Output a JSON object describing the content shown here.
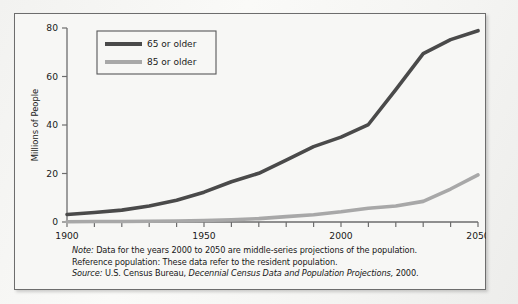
{
  "figure": {
    "background_color": "#f7f7f5",
    "frame_color": "#6d6d6d"
  },
  "axes": {
    "y_title": "Millions of People",
    "y_ticks": [
      "0",
      "20",
      "40",
      "60",
      "80"
    ],
    "x_ticks_labeled": [
      "1900",
      "1950",
      "2000",
      "2050"
    ]
  },
  "legend": {
    "items": [
      {
        "label": "65 or older",
        "color": "#4a4a4a"
      },
      {
        "label": "85 or older",
        "color": "#a8a8a8"
      }
    ]
  },
  "notes": {
    "note_keyword": "Note:",
    "note_text": "Data for the years 2000 to 2050 are middle-series projections of the population.",
    "reference_text": "Reference population: These data refer to the resident population.",
    "source_keyword": "Source:",
    "source_agency": "U.S. Census Bureau,",
    "source_title": "Decennial Census Data and Population Projections,",
    "source_year": "2000."
  },
  "chart_data": {
    "type": "line",
    "title": "",
    "xlabel": "",
    "ylabel": "Millions of People",
    "xlim": [
      1900,
      2050
    ],
    "ylim": [
      0,
      80
    ],
    "xticks": [
      1900,
      1910,
      1920,
      1930,
      1940,
      1950,
      1960,
      1970,
      1980,
      1990,
      2000,
      2010,
      2020,
      2030,
      2040,
      2050
    ],
    "xtick_labels": [
      "1900",
      "",
      "",
      "",
      "",
      "1950",
      "",
      "",
      "",
      "",
      "2000",
      "",
      "",
      "",
      "",
      "2050"
    ],
    "yticks": [
      0,
      20,
      40,
      60,
      80
    ],
    "grid": false,
    "legend_position": "upper left",
    "x": [
      1900,
      1910,
      1920,
      1930,
      1940,
      1950,
      1960,
      1970,
      1980,
      1990,
      2000,
      2010,
      2020,
      2030,
      2040,
      2050
    ],
    "series": [
      {
        "name": "65 or older",
        "color": "#4a4a4a",
        "values": [
          3.1,
          3.9,
          4.9,
          6.6,
          9.0,
          12.3,
          16.6,
          20.1,
          25.5,
          31.1,
          35.0,
          40.2,
          54.6,
          69.4,
          75.2,
          78.9
        ]
      },
      {
        "name": "85 or older",
        "color": "#a8a8a8",
        "values": [
          0.1,
          0.2,
          0.2,
          0.3,
          0.4,
          0.6,
          0.9,
          1.4,
          2.2,
          3.0,
          4.2,
          5.7,
          6.6,
          8.5,
          13.6,
          19.4
        ]
      }
    ]
  }
}
